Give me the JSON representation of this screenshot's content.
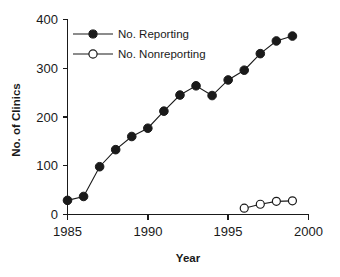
{
  "chart_data": {
    "type": "line",
    "title": "",
    "xlabel": "Year",
    "ylabel": "No. of Clinics",
    "xlim": [
      1985,
      2000
    ],
    "ylim": [
      0,
      400
    ],
    "xticks": [
      "1985",
      "1990",
      "1995",
      "2000"
    ],
    "xtick_values": [
      1985,
      1990,
      1995,
      2000
    ],
    "yticks": [
      "0",
      "100",
      "200",
      "300",
      "400"
    ],
    "ytick_values": [
      0,
      100,
      200,
      300,
      400
    ],
    "grid": false,
    "legend_position": "upper-left-inside",
    "series": [
      {
        "name": "No. Reporting",
        "marker": "filled-circle",
        "color": "#1a1a1a",
        "x": [
          1985,
          1986,
          1987,
          1988,
          1989,
          1990,
          1991,
          1992,
          1993,
          1994,
          1995,
          1996,
          1997,
          1998,
          1999
        ],
        "values": [
          29,
          37,
          98,
          133,
          160,
          177,
          212,
          245,
          264,
          244,
          276,
          296,
          330,
          356,
          366
        ]
      },
      {
        "name": "No. Nonreporting",
        "marker": "open-circle",
        "color": "#1a1a1a",
        "x": [
          1996,
          1997,
          1998,
          1999
        ],
        "values": [
          13,
          21,
          27,
          28
        ]
      }
    ]
  },
  "legend": {
    "entries": [
      {
        "label": "No. Reporting",
        "marker": "filled-circle"
      },
      {
        "label": "No. Nonreporting",
        "marker": "open-circle"
      }
    ]
  },
  "axes": {
    "y_axis_title": "No. of Clinics",
    "x_axis_title": "Year"
  }
}
